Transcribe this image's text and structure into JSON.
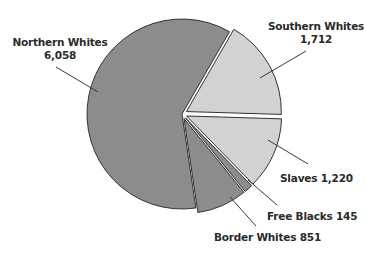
{
  "chart_data": {
    "type": "pie",
    "title": "",
    "exploded": true,
    "start_angle_deg": -60,
    "direction": "clockwise",
    "slices": [
      {
        "label": "Southern Whites",
        "value": 1712,
        "value_text": "1,712",
        "color": "#d2d2d2",
        "offset": 5
      },
      {
        "label": "Slaves",
        "value": 1220,
        "value_text": "1,220",
        "color": "#d2d2d2",
        "offset": 5
      },
      {
        "label": "Free Blacks",
        "value": 145,
        "value_text": "145",
        "color": "#8c8c8c",
        "offset": 5
      },
      {
        "label": "Border Whites",
        "value": 851,
        "value_text": "851",
        "color": "#8c8c8c",
        "offset": 5
      },
      {
        "label": "Northern Whites",
        "value": 6058,
        "value_text": "6,058",
        "color": "#8c8c8c",
        "offset": 0
      }
    ]
  },
  "labels": {
    "northern": {
      "name": "Northern Whites",
      "value": "6,058"
    },
    "southern": {
      "name": "Southern Whites",
      "value": "1,712"
    },
    "slaves": {
      "text": "Slaves 1,220"
    },
    "free_blacks": {
      "text": "Free Blacks 145"
    },
    "border": {
      "text": "Border Whites 851"
    }
  }
}
